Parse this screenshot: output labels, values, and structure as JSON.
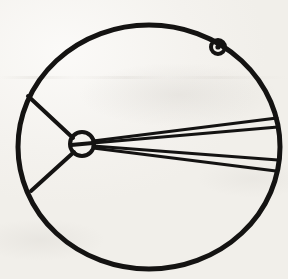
{
  "image": {
    "title": "Hand-drawn circle diagram with central hub and radiating lines",
    "medium": "scanned ink line drawing on off-white paper",
    "width": 288,
    "height": 279,
    "background_color": "#f3f1ec",
    "ink_color": "#141312"
  },
  "geometry": {
    "outer_circle": {
      "name": "outer-circle",
      "center_x": 149,
      "center_y": 147,
      "radius_x": 131,
      "radius_y": 122,
      "stroke_width": 5,
      "bounds": {
        "left": 18,
        "top": 25,
        "right": 280,
        "bottom": 269
      }
    },
    "hub_circle": {
      "name": "hub-circle",
      "center_x": 82,
      "center_y": 144,
      "radius": 12,
      "stroke_width": 4,
      "inner_bar": {
        "name": "hub-inner-bar",
        "x1": 71,
        "y1": 145,
        "x2": 93,
        "y2": 143,
        "stroke_width": 4
      }
    },
    "bead": {
      "name": "bead-marker",
      "center_x": 218,
      "center_y": 47,
      "outer_radius": 7,
      "inner_radius": 2.6,
      "stroke_width": 4
    },
    "left_spokes": [
      {
        "name": "spoke-upper-left",
        "x1": 73,
        "y1": 138,
        "x2": 28,
        "y2": 96,
        "stroke_width": 4
      },
      {
        "name": "spoke-lower-left",
        "x1": 74,
        "y1": 152,
        "x2": 31,
        "y2": 191,
        "stroke_width": 4
      }
    ],
    "right_fan": [
      {
        "name": "fan-line-1",
        "x1": 93,
        "y1": 141,
        "x2": 277,
        "y2": 118,
        "stroke_width": 3
      },
      {
        "name": "fan-line-2",
        "x1": 93,
        "y1": 143,
        "x2": 278,
        "y2": 127,
        "stroke_width": 3
      },
      {
        "name": "fan-line-3",
        "x1": 93,
        "y1": 146,
        "x2": 278,
        "y2": 160,
        "stroke_width": 3
      },
      {
        "name": "fan-line-4",
        "x1": 93,
        "y1": 148,
        "x2": 276,
        "y2": 171,
        "stroke_width": 3
      }
    ]
  },
  "labels": {
    "text_present": "none",
    "annotations": []
  }
}
